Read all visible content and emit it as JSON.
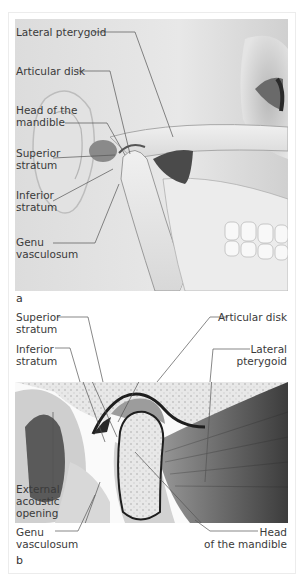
{
  "figure": {
    "panel_a": {
      "letter": "a",
      "labels": {
        "lateral_pterygoid": "Lateral pterygoid",
        "articular_disk": "Articular disk",
        "head_of_mandible_1": "Head of the",
        "head_of_mandible_2": "mandible",
        "superior_stratum_1": "Superior",
        "superior_stratum_2": "stratum",
        "inferior_stratum_1": "Inferior",
        "inferior_stratum_2": "stratum",
        "genu_vasculosum_1": "Genu",
        "genu_vasculosum_2": "vasculosum"
      }
    },
    "panel_b": {
      "letter": "b",
      "labels": {
        "superior_stratum_1": "Superior",
        "superior_stratum_2": "stratum",
        "inferior_stratum_1": "Inferior",
        "inferior_stratum_2": "stratum",
        "articular_disk": "Articular disk",
        "lateral_pterygoid_1": "Lateral",
        "lateral_pterygoid_2": "pterygoid",
        "external_acoustic_1": "External",
        "external_acoustic_2": "acoustic",
        "external_acoustic_3": "opening",
        "genu_vasculosum_1": "Genu",
        "genu_vasculosum_2": "vasculosum",
        "head_of_mandible_1": "Head",
        "head_of_mandible_2": "of the mandible"
      }
    }
  }
}
